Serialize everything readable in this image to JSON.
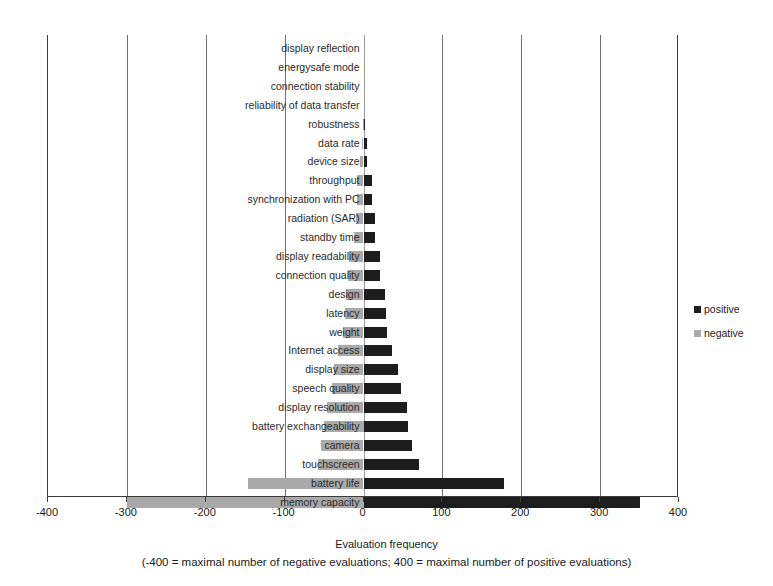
{
  "chart_data": {
    "type": "bar",
    "orientation": "horizontal",
    "title": "",
    "xlabel": "Evaluation frequency",
    "xsublabel": "(-400 = maximal number of negative evaluations; 400 = maximal number of positive evaluations)",
    "ylabel": "",
    "xlim": [
      -400,
      400
    ],
    "xticks": [
      -400,
      -300,
      -200,
      -100,
      0,
      100,
      200,
      300,
      400
    ],
    "xticklabels": [
      "-400",
      "-300",
      "-200",
      "-100",
      "0",
      "100",
      "200",
      "300",
      "400"
    ],
    "grid": true,
    "legend_position": "right",
    "colors": {
      "positive": "#1d1d1d",
      "negative": "#a9a9a9"
    },
    "categories": [
      "display reflection",
      "energysafe mode",
      "connection stability",
      "reliability of data transfer",
      "robustness",
      "data rate",
      "device size",
      "throughput",
      "synchronization with PC",
      "radiation (SAR)",
      "standby time",
      "display readability",
      "connection quality",
      "design",
      "latency",
      "weight",
      "Internet access",
      "display size",
      "speech quality",
      "display resolution",
      "battery exchangeability",
      "camera",
      "touchscreen",
      "battery life",
      "memory capacity"
    ],
    "series": [
      {
        "name": "positive",
        "values": [
          0,
          0,
          0,
          0,
          2,
          4,
          5,
          11,
          11,
          15,
          15,
          21,
          21,
          27,
          28,
          30,
          36,
          44,
          48,
          55,
          57,
          62,
          70,
          178,
          350
        ]
      },
      {
        "name": "negative",
        "values": [
          0,
          0,
          0,
          0,
          -1,
          -2,
          -5,
          -8,
          -8,
          -10,
          -12,
          -18,
          -20,
          -22,
          -24,
          -26,
          -32,
          -38,
          -40,
          -46,
          -50,
          -54,
          -58,
          -146,
          -300
        ]
      }
    ]
  },
  "legend": {
    "items": [
      {
        "label": "positive",
        "color": "#1d1d1d"
      },
      {
        "label": "negative",
        "color": "#a9a9a9"
      }
    ]
  }
}
